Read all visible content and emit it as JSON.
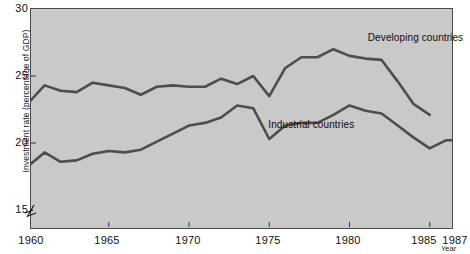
{
  "chart_data": {
    "type": "line",
    "title": "",
    "xlabel": "Year",
    "ylabel": "Investment rate (percentage of GDP)",
    "xlim": [
      1960,
      1987
    ],
    "ylim": [
      15,
      30
    ],
    "yticks": [
      15,
      20,
      25,
      30
    ],
    "xticks": [
      1960,
      1965,
      1970,
      1975,
      1980,
      1985,
      1987
    ],
    "grid": false,
    "axis_break": true,
    "legend": "inline-annotations",
    "series": [
      {
        "name": "Developing countries",
        "label_x": 1981.2,
        "label_y": 27.8,
        "x": [
          1960,
          1961,
          1962,
          1963,
          1964,
          1965,
          1966,
          1967,
          1968,
          1969,
          1970,
          1971,
          1972,
          1973,
          1974,
          1975,
          1976,
          1977,
          1978,
          1979,
          1980,
          1981,
          1982,
          1983,
          1984,
          1985
        ],
        "values": [
          23.0,
          24.3,
          23.9,
          23.8,
          24.5,
          24.3,
          24.1,
          23.6,
          24.2,
          24.3,
          24.2,
          24.2,
          24.8,
          24.4,
          25.0,
          23.5,
          25.6,
          26.4,
          26.4,
          27.0,
          26.5,
          26.3,
          26.2,
          24.6,
          22.9,
          22.1
        ]
      },
      {
        "name": "Industrial countries",
        "label_x": 1975.0,
        "label_y": 21.3,
        "x": [
          1960,
          1961,
          1962,
          1963,
          1964,
          1965,
          1966,
          1967,
          1968,
          1969,
          1970,
          1971,
          1972,
          1973,
          1974,
          1975,
          1976,
          1977,
          1978,
          1979,
          1980,
          1981,
          1982,
          1983,
          1984,
          1985,
          1986,
          1987
        ],
        "values": [
          18.3,
          19.3,
          18.6,
          18.7,
          19.2,
          19.4,
          19.3,
          19.5,
          20.1,
          20.7,
          21.3,
          21.5,
          21.9,
          22.8,
          22.6,
          20.3,
          21.3,
          21.5,
          21.5,
          22.1,
          22.8,
          22.4,
          22.2,
          21.3,
          20.4,
          19.6,
          20.2,
          20.2
        ]
      }
    ]
  },
  "axes": {
    "y_tick_labels": [
      "30",
      "25",
      "20",
      "15"
    ],
    "x_tick_labels": [
      "1960",
      "1965",
      "1970",
      "1975",
      "1980",
      "1985",
      "1987"
    ],
    "y_axis_title": "Investment rate (percentage of GDP)",
    "x_axis_title": "Year"
  },
  "annotations": {
    "developing": "Developing countries",
    "industrial": "Industrial countries"
  },
  "colors": {
    "plot_background": "#c9c9c9",
    "line": "#4d4d4d",
    "axis": "#4a4a4a",
    "text": "#111111",
    "page_background": "#ffffff"
  }
}
